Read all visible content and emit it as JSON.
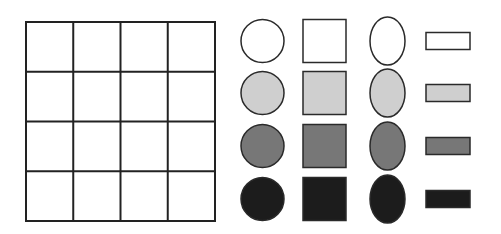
{
  "figure": {
    "grid": {
      "rows": 4,
      "cols": 4,
      "x": 26,
      "y": 22,
      "width": 189,
      "height": 199,
      "stroke": "#222222"
    },
    "fills": {
      "white": "#ffffff",
      "light_gray": "#cfcfcf",
      "mid_gray": "#777777",
      "black": "#1c1c1c"
    },
    "stroke_color": "#2a2a2a",
    "shape_columns": [
      {
        "shape": "circle",
        "label": "circle-column"
      },
      {
        "shape": "square",
        "label": "square-column"
      },
      {
        "shape": "ellipse",
        "label": "ellipse-column"
      },
      {
        "shape": "bar",
        "label": "bar-column"
      }
    ],
    "shape_rows": [
      {
        "fill": "white",
        "cy": 41
      },
      {
        "fill": "light_gray",
        "cy": 93
      },
      {
        "fill": "mid_gray",
        "cy": 146
      },
      {
        "fill": "black",
        "cy": 199
      }
    ]
  }
}
